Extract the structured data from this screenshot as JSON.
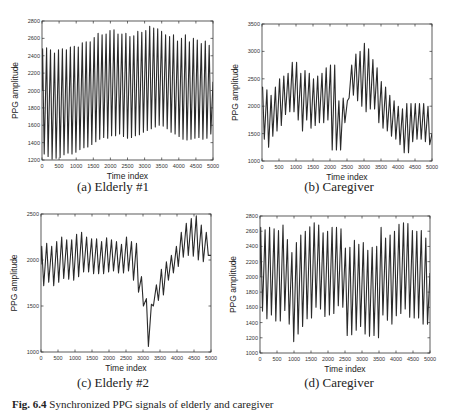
{
  "figure": {
    "caption_label": "Fig. 6.4",
    "caption_text": "Synchronized PPG signals of elderly and caregiver"
  },
  "chart_data": [
    {
      "type": "line",
      "id": "a",
      "title": "(a) Elderly #1",
      "xlabel": "Time index",
      "ylabel": "PPG amplitude",
      "xlim": [
        0,
        5000
      ],
      "ylim": [
        1200,
        2800
      ],
      "xticks": [
        0,
        500,
        1000,
        1500,
        2000,
        2500,
        3000,
        3500,
        4000,
        4500,
        5000
      ],
      "yticks": [
        1200,
        1400,
        1600,
        1800,
        2000,
        2200,
        2400,
        2600,
        2800
      ],
      "frame": {
        "left": 42,
        "top": 21,
        "right": 213,
        "bottom": 160
      },
      "start": 2000,
      "peaks": [
        2480,
        2490,
        2470,
        2430,
        2470,
        2480,
        2470,
        2500,
        2510,
        2500,
        2550,
        2560,
        2560,
        2610,
        2660,
        2640,
        2650,
        2690,
        2700,
        2650,
        2650,
        2660,
        2620,
        2630,
        2680,
        2670,
        2690,
        2740,
        2720,
        2710,
        2680,
        2640,
        2620,
        2640,
        2570,
        2600,
        2640,
        2560,
        2600,
        2580,
        2540,
        2570,
        2520
      ],
      "troughs": [
        1270,
        1240,
        1210,
        1220,
        1230,
        1260,
        1280,
        1270,
        1290,
        1320,
        1340,
        1350,
        1380,
        1410,
        1440,
        1460,
        1450,
        1480,
        1480,
        1500,
        1470,
        1450,
        1460,
        1480,
        1490,
        1520,
        1540,
        1560,
        1580,
        1600,
        1590,
        1560,
        1520,
        1500,
        1470,
        1440,
        1430,
        1440,
        1450,
        1460,
        1440,
        1450,
        1500
      ],
      "end": 2100
    },
    {
      "type": "line",
      "id": "b",
      "title": "(b) Caregiver",
      "xlabel": "Time index",
      "ylabel": "PPG amplitude",
      "xlim": [
        0,
        5000
      ],
      "ylim": [
        1000,
        3500
      ],
      "xticks": [
        0,
        500,
        1000,
        1500,
        2000,
        2500,
        3000,
        3500,
        4000,
        4500,
        5000
      ],
      "yticks": [
        1000,
        1500,
        2000,
        2500,
        3000,
        3500
      ],
      "frame": {
        "left": 262,
        "top": 24,
        "right": 432,
        "bottom": 161
      },
      "start": 2300,
      "peaks": [
        2350,
        2300,
        2200,
        2350,
        2500,
        2550,
        2600,
        2800,
        2800,
        2600,
        2650,
        2600,
        2500,
        2550,
        2600,
        2700,
        2750,
        2750,
        2100,
        2150,
        2100,
        2750,
        2950,
        3000,
        3150,
        3050,
        2850,
        2700,
        2450,
        2350,
        2200,
        2100,
        2000,
        1950,
        2050,
        2050,
        2050,
        2050,
        2050,
        2000
      ],
      "troughs": [
        1400,
        1250,
        1450,
        1550,
        1650,
        1850,
        1900,
        1900,
        1750,
        1550,
        1750,
        1600,
        1650,
        1700,
        1700,
        1750,
        1200,
        1200,
        1200,
        1700,
        2150,
        2200,
        2100,
        2000,
        1900,
        1950,
        1950,
        1700,
        1600,
        1550,
        1450,
        1400,
        1300,
        1150,
        1150,
        1350,
        1400,
        1400,
        1350,
        1300
      ],
      "end": 1500
    },
    {
      "type": "line",
      "id": "c",
      "title": "(c) Elderly #2",
      "xlabel": "Time index",
      "ylabel": "PPG amplitude",
      "xlim": [
        0,
        5000
      ],
      "ylim": [
        1000,
        2500
      ],
      "xticks": [
        0,
        500,
        1000,
        1500,
        2000,
        2500,
        3000,
        3500,
        4000,
        4500,
        5000
      ],
      "yticks": [
        1000,
        1500,
        2000,
        2500
      ],
      "frame": {
        "left": 41,
        "top": 214,
        "right": 211,
        "bottom": 352
      },
      "start": 1950,
      "peaks": [
        2150,
        2180,
        2150,
        2200,
        2250,
        2220,
        2220,
        2280,
        2300,
        2250,
        2230,
        2230,
        2200,
        2240,
        2220,
        2200,
        2170,
        2250,
        2200,
        2180,
        1820,
        1580,
        1520,
        1730,
        1900,
        1980,
        2050,
        2150,
        2300,
        2400,
        2450,
        2480,
        2380,
        2300
      ],
      "troughs": [
        1720,
        1760,
        1720,
        1760,
        1800,
        1790,
        1780,
        1820,
        1870,
        1870,
        1850,
        1850,
        1850,
        1870,
        1880,
        1860,
        1860,
        1880,
        1780,
        1650,
        1500,
        1060,
        1500,
        1560,
        1620,
        1780,
        1860,
        1930,
        2030,
        2050,
        2040,
        2000,
        1980,
        2050
      ],
      "end": 2050
    },
    {
      "type": "line",
      "id": "d",
      "title": "(d) Caregiver",
      "xlabel": "Time index",
      "ylabel": "PPG amplitude",
      "xlim": [
        0,
        5000
      ],
      "ylim": [
        1000,
        2800
      ],
      "xticks": [
        0,
        500,
        1000,
        1500,
        2000,
        2500,
        3000,
        3500,
        4000,
        4500,
        5000
      ],
      "yticks": [
        1000,
        1200,
        1400,
        1600,
        1800,
        2000,
        2200,
        2400,
        2600,
        2800
      ],
      "frame": {
        "left": 260,
        "top": 216,
        "right": 430,
        "bottom": 353
      },
      "start": 2000,
      "peaks": [
        2650,
        2620,
        2650,
        2630,
        2610,
        2680,
        2490,
        2320,
        2450,
        2550,
        2600,
        2660,
        2710,
        2680,
        2580,
        2600,
        2650,
        2650,
        2630,
        2380,
        2390,
        2480,
        2430,
        2450,
        2350,
        2390,
        2400,
        2650,
        2510,
        2550,
        2600,
        2690,
        2710,
        2700,
        2610,
        2600,
        2610,
        2510
      ],
      "troughs": [
        1550,
        1450,
        1500,
        1420,
        1420,
        1560,
        1380,
        1150,
        1250,
        1350,
        1450,
        1460,
        1600,
        1580,
        1480,
        1500,
        1520,
        1620,
        1600,
        1230,
        1240,
        1300,
        1350,
        1250,
        1220,
        1230,
        1200,
        1500,
        1430,
        1380,
        1490,
        1520,
        1580,
        1470,
        1460,
        1460,
        1380,
        1380
      ],
      "end": 2050
    }
  ]
}
